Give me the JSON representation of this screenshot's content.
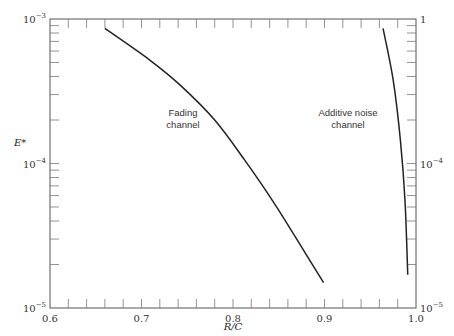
{
  "chart_data": {
    "type": "line",
    "title": "",
    "xlabel": "R/C",
    "ylabel": "E*",
    "xlim": [
      0.6,
      1.0
    ],
    "ylim": [
      1e-05,
      0.001
    ],
    "yscale": "log",
    "grid": false,
    "x_ticks": [
      {
        "value": 0.6,
        "label": "0.6"
      },
      {
        "value": 0.7,
        "label": "0.7"
      },
      {
        "value": 0.8,
        "label": "0.8"
      },
      {
        "value": 0.9,
        "label": "0.9"
      },
      {
        "value": 1.0,
        "label": "1.0"
      }
    ],
    "x_minor_step": 0.02,
    "y_left_ticks": [
      {
        "value": 0.001,
        "base": "10",
        "exp": "−3"
      },
      {
        "value": 0.0001,
        "base": "10",
        "exp": "−4"
      },
      {
        "value": 1e-05,
        "base": "10",
        "exp": "−5"
      }
    ],
    "y_right_ticks": [
      {
        "value": 0.001,
        "base": "1",
        "exp": ""
      },
      {
        "value": 0.0001,
        "base": "10",
        "exp": "−4"
      },
      {
        "value": 1e-05,
        "base": "10",
        "exp": "−5"
      }
    ],
    "series": [
      {
        "name": "Fading channel",
        "label_lines": [
          "Fading",
          "channel"
        ],
        "x": [
          0.66,
          0.709,
          0.742,
          0.78,
          0.813,
          0.846,
          0.879,
          0.899
        ],
        "y": [
          0.00086,
          0.00052,
          0.00035,
          0.0002,
          0.000105,
          5.2e-05,
          2.4e-05,
          1.5e-05
        ]
      },
      {
        "name": "Additive noise channel",
        "label_lines": [
          "Additive noise",
          "channel"
        ],
        "x": [
          0.964,
          0.975,
          0.983,
          0.988,
          0.991
        ],
        "y": [
          0.00086,
          0.00038,
          0.000144,
          5.5e-05,
          1.7e-05
        ]
      }
    ],
    "annotations": [
      {
        "text": "Fading channel",
        "near": {
          "x": 0.76,
          "y": 0.00026
        }
      },
      {
        "text": "Additive noise channel",
        "near": {
          "x": 0.91,
          "y": 0.00026
        }
      }
    ]
  }
}
